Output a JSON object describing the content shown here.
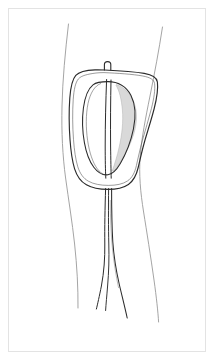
{
  "page": {
    "width": 215,
    "height": 362,
    "background_color": "#ffffff",
    "title": "Hand-drawn anatomical line sketch"
  },
  "frame": {
    "border_color": "#e3e3e3",
    "border_width": 1,
    "inset": 8,
    "fill_color": "#ffffff"
  },
  "drawing": {
    "style": "hand-drawn contour line sketch",
    "stroke_color": "#2b2b2b",
    "light_stroke_color": "#8a8a8a",
    "shade_color": "#d9d9d9",
    "shade_stroke_color": "#a8a8a8",
    "elements": [
      {
        "name": "left-body-contour",
        "label": "Left outer contour line"
      },
      {
        "name": "right-body-contour",
        "label": "Right outer contour line"
      },
      {
        "name": "rounded-square-outline",
        "label": "Rounded square outline"
      },
      {
        "name": "inner-oval-outline",
        "label": "Inner teardrop oval"
      },
      {
        "name": "oval-shading",
        "label": "Gray shaded crescent"
      },
      {
        "name": "center-line-left",
        "label": "Left central vertical line"
      },
      {
        "name": "center-line-right",
        "label": "Right central vertical line"
      },
      {
        "name": "top-nub",
        "label": "Small rectangular nub at top"
      },
      {
        "name": "strand-left",
        "label": "Left trailing strand"
      },
      {
        "name": "strand-middle",
        "label": "Middle trailing strand"
      },
      {
        "name": "strand-right",
        "label": "Right trailing strand"
      }
    ]
  }
}
